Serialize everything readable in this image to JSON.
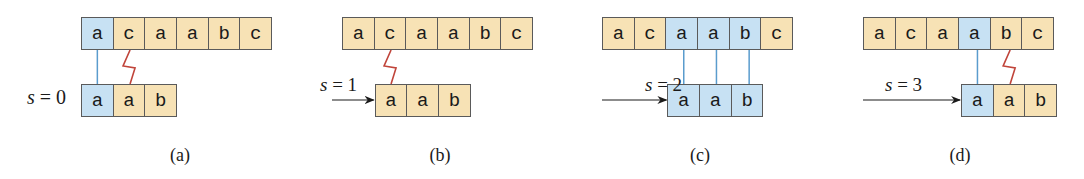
{
  "colors": {
    "match_fill": "#c7e1f3",
    "neutral_fill": "#f7e2b5",
    "cell_border": "#5a5a5a",
    "match_line": "#5a9ccd",
    "mismatch_zigzag": "#c0443a"
  },
  "text": "acaabc",
  "pattern": "aab",
  "panels": [
    {
      "caption": "(a)",
      "shift_var": "s",
      "shift_eq": " = 0",
      "shift": 0,
      "has_arrow": false,
      "text_cells": [
        {
          "char": "a",
          "state": "match"
        },
        {
          "char": "c",
          "state": "neutral"
        },
        {
          "char": "a",
          "state": "neutral"
        },
        {
          "char": "a",
          "state": "neutral"
        },
        {
          "char": "b",
          "state": "neutral"
        },
        {
          "char": "c",
          "state": "neutral"
        }
      ],
      "pattern_cells": [
        {
          "char": "a",
          "state": "match"
        },
        {
          "char": "a",
          "state": "neutral"
        },
        {
          "char": "b",
          "state": "neutral"
        }
      ],
      "match_lines": [
        0
      ],
      "mismatch_at": 1
    },
    {
      "caption": "(b)",
      "shift_var": "s",
      "shift_eq": " = 1",
      "shift": 1,
      "has_arrow": true,
      "text_cells": [
        {
          "char": "a",
          "state": "neutral"
        },
        {
          "char": "c",
          "state": "neutral"
        },
        {
          "char": "a",
          "state": "neutral"
        },
        {
          "char": "a",
          "state": "neutral"
        },
        {
          "char": "b",
          "state": "neutral"
        },
        {
          "char": "c",
          "state": "neutral"
        }
      ],
      "pattern_cells": [
        {
          "char": "a",
          "state": "neutral"
        },
        {
          "char": "a",
          "state": "neutral"
        },
        {
          "char": "b",
          "state": "neutral"
        }
      ],
      "match_lines": [],
      "mismatch_at": 0
    },
    {
      "caption": "(c)",
      "shift_var": "s",
      "shift_eq": " = 2",
      "shift": 2,
      "has_arrow": true,
      "text_cells": [
        {
          "char": "a",
          "state": "neutral"
        },
        {
          "char": "c",
          "state": "neutral"
        },
        {
          "char": "a",
          "state": "match"
        },
        {
          "char": "a",
          "state": "match"
        },
        {
          "char": "b",
          "state": "match"
        },
        {
          "char": "c",
          "state": "neutral"
        }
      ],
      "pattern_cells": [
        {
          "char": "a",
          "state": "match"
        },
        {
          "char": "a",
          "state": "match"
        },
        {
          "char": "b",
          "state": "match"
        }
      ],
      "match_lines": [
        0,
        1,
        2
      ],
      "mismatch_at": null
    },
    {
      "caption": "(d)",
      "shift_var": "s",
      "shift_eq": " = 3",
      "shift": 3,
      "has_arrow": true,
      "text_cells": [
        {
          "char": "a",
          "state": "neutral"
        },
        {
          "char": "c",
          "state": "neutral"
        },
        {
          "char": "a",
          "state": "neutral"
        },
        {
          "char": "a",
          "state": "match"
        },
        {
          "char": "b",
          "state": "neutral"
        },
        {
          "char": "c",
          "state": "neutral"
        }
      ],
      "pattern_cells": [
        {
          "char": "a",
          "state": "match"
        },
        {
          "char": "a",
          "state": "neutral"
        },
        {
          "char": "b",
          "state": "neutral"
        }
      ],
      "match_lines": [
        0
      ],
      "mismatch_at": 1
    }
  ]
}
